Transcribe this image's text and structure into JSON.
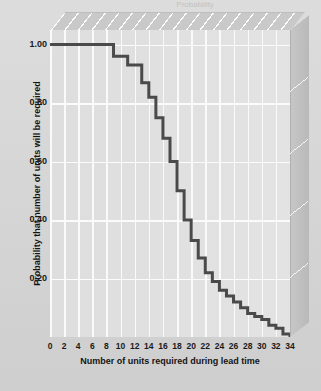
{
  "caption": {
    "truncated_text": "Probability"
  },
  "axes": {
    "x": {
      "label": "Number of units required during lead time",
      "ticks": [
        "0",
        "2",
        "4",
        "6",
        "8",
        "10",
        "12",
        "14",
        "16",
        "18",
        "20",
        "22",
        "24",
        "26",
        "28",
        "30",
        "32",
        "34"
      ],
      "min": 0,
      "max": 34
    },
    "y": {
      "label": "Probability that number of units will be required",
      "ticks": [
        "1.00",
        "0.80",
        "0.60",
        "0.40",
        "0.20"
      ],
      "min": 0.0,
      "max": 1.05
    }
  },
  "colors": {
    "curve": "#4a4a4a",
    "plot_background": "#e2e2e2",
    "gridline": "#fafafa",
    "figure_background": "#d5d5d5",
    "box_side": "#c0c0c0",
    "text": "#141414"
  },
  "chart_data": {
    "type": "line",
    "title": "",
    "subtitle": "",
    "xlabel": "Number of units required during lead time",
    "ylabel": "Probability that number of units will be required",
    "xlim": [
      0,
      34
    ],
    "ylim": [
      0,
      1.05
    ],
    "grid": "vertical-and-horizontal",
    "legend": "none",
    "step_style": "post",
    "x": [
      0,
      2,
      4,
      6,
      8,
      9,
      10,
      11,
      12,
      13,
      14,
      15,
      16,
      17,
      18,
      19,
      20,
      21,
      22,
      23,
      24,
      25,
      26,
      27,
      28,
      29,
      30,
      31,
      32,
      33,
      34
    ],
    "y": [
      1.0,
      1.0,
      1.0,
      1.0,
      1.0,
      0.96,
      0.96,
      0.93,
      0.93,
      0.87,
      0.82,
      0.75,
      0.68,
      0.6,
      0.5,
      0.4,
      0.33,
      0.27,
      0.22,
      0.19,
      0.16,
      0.14,
      0.12,
      0.1,
      0.08,
      0.07,
      0.06,
      0.04,
      0.03,
      0.01,
      0.0
    ],
    "series": [
      {
        "name": "Probability that number of units will be required",
        "values": [
          1.0,
          1.0,
          1.0,
          1.0,
          1.0,
          0.96,
          0.96,
          0.93,
          0.93,
          0.87,
          0.82,
          0.75,
          0.68,
          0.6,
          0.5,
          0.4,
          0.33,
          0.27,
          0.22,
          0.19,
          0.16,
          0.14,
          0.12,
          0.1,
          0.08,
          0.07,
          0.06,
          0.04,
          0.03,
          0.01,
          0.0
        ]
      }
    ],
    "annotations": []
  }
}
